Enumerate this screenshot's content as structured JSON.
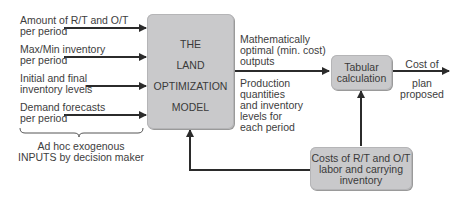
{
  "inputs": {
    "items": [
      {
        "line1": "Amount of R/T and O/T",
        "line2": "per period"
      },
      {
        "line1": "Max/Min inventory",
        "line2": "per period"
      },
      {
        "line1": "Initial and final",
        "line2": "inventory levels"
      },
      {
        "line1": "Demand forecasts",
        "line2": "per period"
      }
    ],
    "group_label_line1": "Ad hoc exogenous",
    "group_label_line2": "INPUTS by decision maker"
  },
  "model_box": {
    "lines": [
      "THE",
      "LAND",
      "OPTIMIZATION",
      "MODEL"
    ]
  },
  "outputs": {
    "top_label": [
      "Mathematically",
      "optimal (min. cost)",
      "outputs"
    ],
    "bottom_label": [
      "Production",
      "quantities",
      "and inventory",
      "levels for",
      "each period"
    ]
  },
  "tabular_box": {
    "lines": [
      "Tabular",
      "calculation"
    ]
  },
  "result": {
    "line1": "Cost of",
    "line2": "plan",
    "line3": "proposed"
  },
  "costs_box": {
    "lines": [
      "Costs of R/T and O/T",
      "labor and carrying",
      "inventory"
    ]
  },
  "colors": {
    "box_fill": "#c9c9cb",
    "line": "#2b2b2b",
    "text": "#3a3a3a"
  }
}
